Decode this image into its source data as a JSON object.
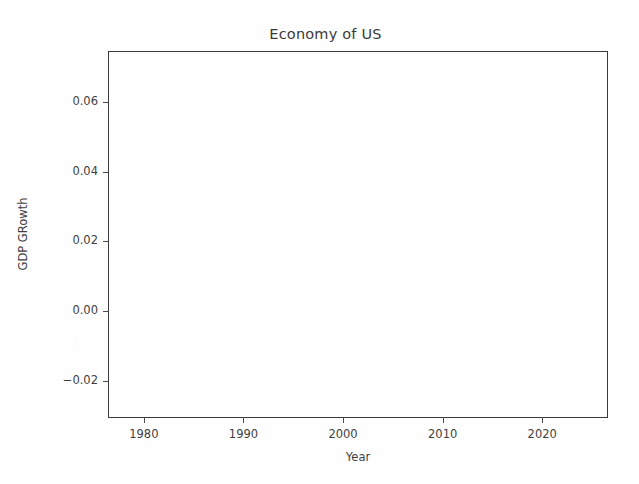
{
  "chart_data": {
    "type": "line",
    "title": "Economy of US",
    "xlabel": "Year",
    "ylabel": "GDP GRowth",
    "grid": false,
    "legend": null,
    "xlim": [
      1976.5,
      2026.5
    ],
    "ylim": [
      -0.0305,
      0.0745
    ],
    "xticks": [
      1980,
      1990,
      2000,
      2010,
      2020
    ],
    "xtick_labels": [
      "1980",
      "1990",
      "2000",
      "2010",
      "2020"
    ],
    "yticks": [
      -0.02,
      0.0,
      0.02,
      0.04,
      0.06
    ],
    "ytick_labels": [
      "−0.02",
      "0.00",
      "0.02",
      "0.04",
      "0.06"
    ],
    "series": [],
    "x": [],
    "values": [],
    "note": "Empty axes — no data series rendered inside the plot box."
  },
  "figure": {
    "title": "Economy of US",
    "axis": {
      "x_label": "Year",
      "y_label": "GDP GRowth",
      "x_tick_labels": [
        "1980",
        "1990",
        "2000",
        "2010",
        "2020"
      ],
      "y_tick_labels": [
        "0.06",
        "0.04",
        "0.02",
        "0.00",
        "−0.02"
      ]
    }
  },
  "colors": {
    "background": "#fefefe",
    "plot_background": "#ffffff",
    "axis_line": "#3a3a3a",
    "text": "#3f3f3f",
    "title_text": "#3b3b3b"
  }
}
